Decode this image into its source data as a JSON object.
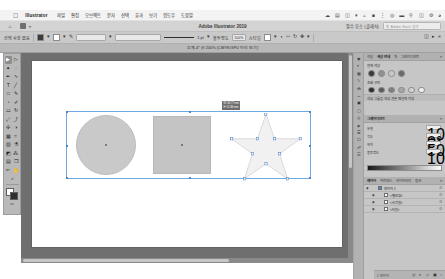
{
  "macbar": {
    "apple_icon": "apple-logo-icon",
    "app_name": "Illustrator",
    "menus": [
      "파일",
      "편집",
      "오브젝트",
      "문자",
      "선택",
      "효과",
      "보기",
      "윈도우",
      "도움말"
    ],
    "status_icons": [
      "dropbox-icon",
      "battery-icon",
      "display-icon",
      "wifi-icon",
      "bluetooth-icon",
      "volume-icon",
      "input-icon",
      "clock-icon",
      "keyboard-icon",
      "search-icon",
      "control-center-icon",
      "settings-icon",
      "siri-icon"
    ]
  },
  "appbar": {
    "home_icon": "home-icon",
    "grid_icon": "arrange-documents-icon",
    "caret_icon": "chevron-down-icon",
    "title": "Adobe Illustrator 2019",
    "workspace_label": "필수 요소 (클래식)",
    "search_icon": "search-icon",
    "search_placeholder": "Adobe Stock 검색"
  },
  "controlbar": {
    "selection_label": "선택 사항 없음",
    "fill_label": "칠",
    "stroke_label": "획",
    "stroke_weight": "1 pt",
    "opacity_label": "불투명도",
    "opacity_value": "100%",
    "style_label": "스타일",
    "align_label": "정렬",
    "transform_label": "변형",
    "doc_setup": "문서 설정",
    "preferences": "환경 설정",
    "units": "mm",
    "icons": [
      "fill-swatch",
      "stroke-swatch",
      "stroke-profile-icon",
      "brush-icon",
      "opacity-icon",
      "align-icon",
      "transform-icon",
      "arrange-icon",
      "reflect-icon",
      "rotate-icon",
      "options-icon"
    ]
  },
  "tabbar": {
    "document_tab": "무제-4* @ 200% (CMYK/GPU 미리 보기)",
    "close_icon": "close-icon"
  },
  "toolbar": {
    "tools": [
      {
        "name": "selection-tool",
        "glyph": "▶",
        "selected": true
      },
      {
        "name": "direct-selection-tool",
        "glyph": "▷",
        "selected": false
      },
      {
        "name": "magic-wand-tool",
        "glyph": "✦",
        "selected": false
      },
      {
        "name": "lasso-tool",
        "glyph": "◌",
        "selected": false
      },
      {
        "name": "pen-tool",
        "glyph": "✒",
        "selected": false
      },
      {
        "name": "curvature-tool",
        "glyph": "∿",
        "selected": false
      },
      {
        "name": "type-tool",
        "glyph": "T",
        "selected": false
      },
      {
        "name": "line-segment-tool",
        "glyph": "╱",
        "selected": false
      },
      {
        "name": "rectangle-tool",
        "glyph": "□",
        "selected": false
      },
      {
        "name": "paintbrush-tool",
        "glyph": "✎",
        "selected": false
      },
      {
        "name": "shaper-tool",
        "glyph": "◔",
        "selected": false
      },
      {
        "name": "pencil-tool",
        "glyph": "✐",
        "selected": false
      },
      {
        "name": "eraser-tool",
        "glyph": "▭",
        "selected": false
      },
      {
        "name": "rotate-tool",
        "glyph": "↻",
        "selected": false
      },
      {
        "name": "scale-tool",
        "glyph": "⤢",
        "selected": false
      },
      {
        "name": "width-tool",
        "glyph": "⤴",
        "selected": false
      },
      {
        "name": "free-transform-tool",
        "glyph": "✣",
        "selected": false
      },
      {
        "name": "shape-builder-tool",
        "glyph": "◑",
        "selected": false
      },
      {
        "name": "perspective-grid-tool",
        "glyph": "▦",
        "selected": false
      },
      {
        "name": "mesh-tool",
        "glyph": "⌗",
        "selected": false
      },
      {
        "name": "gradient-tool",
        "glyph": "▨",
        "selected": false
      },
      {
        "name": "eyedropper-tool",
        "glyph": "⚗",
        "selected": false
      },
      {
        "name": "blend-tool",
        "glyph": "◩",
        "selected": false
      },
      {
        "name": "symbol-sprayer-tool",
        "glyph": "⁂",
        "selected": false
      },
      {
        "name": "column-graph-tool",
        "glyph": "▤",
        "selected": false
      },
      {
        "name": "artboard-tool",
        "glyph": "❐",
        "selected": false
      },
      {
        "name": "slice-tool",
        "glyph": "✄",
        "selected": false
      },
      {
        "name": "hand-tool",
        "glyph": "✋",
        "selected": false
      },
      {
        "name": "zoom-tool",
        "glyph": "⌕",
        "selected": false
      }
    ],
    "fill_swatch_name": "fill-color-swatch",
    "stroke_swatch_name": "stroke-color-swatch",
    "screen_mode_icon": "screen-mode-icon"
  },
  "canvas": {
    "zoom_level": "200%",
    "shapes": [
      {
        "name": "ellipse-shape",
        "type": "circle",
        "fill": "#c9c9c9"
      },
      {
        "name": "rectangle-shape",
        "type": "square",
        "fill": "#c4c4c4"
      },
      {
        "name": "star-shape",
        "type": "star",
        "fill": "#f1f1f1"
      }
    ],
    "measure_tooltip": "W: 48.77 mm\nH: 51.86 mm",
    "selection_color": "#6fa8dc"
  },
  "dock": {
    "strip_icons": [
      "color-icon",
      "color-guide-icon",
      "swatches-icon",
      "brushes-icon",
      "symbols-icon",
      "stroke-icon",
      "gradient-icon",
      "transparency-icon",
      "appearance-icon",
      "graphic-styles-icon",
      "layers-icon",
      "artboards-icon",
      "links-icon",
      "libraries-icon"
    ],
    "color_panel": {
      "tabs": [
        "색상",
        "색상 안내",
        "획",
        "그레이디언트"
      ],
      "active_tab": "색상 안내",
      "menu_icon": "panel-menu-icon",
      "section_label": "현재 색상",
      "harmony_label": "조화 규칙",
      "swatches_top": [
        "#3a3a3a",
        "#8f8f8f",
        "#c8c8c8",
        "#6a6a6a"
      ],
      "swatches_bottom": [
        "#2e2e2e",
        "#5a5a5a",
        "#7d7d7d",
        "#a6a6a6",
        "#d2d2d2",
        "#ededed"
      ],
      "footer_label": "색상 그룹을 색상 견본 패널에 저장"
    },
    "gradient_panel": {
      "title": "그레이디언트",
      "type_label": "유형",
      "angle_label": "각도",
      "location_label": "위치",
      "opacity_label": "불투명도",
      "values": [
        "100%",
        "0°",
        "50%",
        "100%"
      ]
    },
    "layers_panel": {
      "tabs": [
        "레이어",
        "아트보드",
        "라이브러리",
        "링크"
      ],
      "active_tab": "레이어",
      "rows": [
        {
          "name": "레이어 1",
          "eye": "eye-icon",
          "lock": "",
          "color": "#4a86c8",
          "meta": "O"
        },
        {
          "name": "<별모양>",
          "eye": "eye-icon",
          "lock": "",
          "color": "#ffffff",
          "meta": "O"
        },
        {
          "name": "<사각형>",
          "eye": "eye-icon",
          "lock": "",
          "color": "#ffffff",
          "meta": "O"
        },
        {
          "name": "<타원>",
          "eye": "eye-icon",
          "lock": "",
          "color": "#ffffff",
          "meta": "O"
        }
      ],
      "footer_count": "1 레이어",
      "footer_icons": [
        "locate-object-icon",
        "make-mask-icon",
        "new-sublayer-icon",
        "new-layer-icon",
        "delete-layer-icon"
      ]
    }
  }
}
